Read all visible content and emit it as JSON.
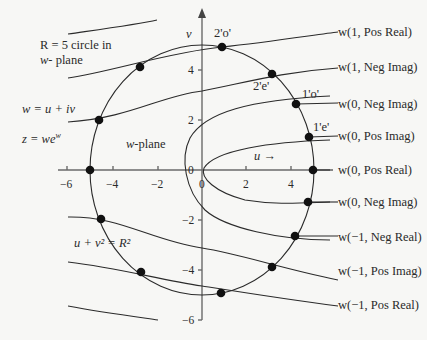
{
  "diagram": {
    "title_note_line1": "R = 5 circle in",
    "title_note_line2_ital": "w",
    "title_note_line2_rest": "- plane",
    "eq_w": "w = u + iv",
    "eq_z": "z = we",
    "eq_z_sup": "w",
    "plane_label_ital": "w",
    "plane_label_rest": "-plane",
    "u_arrow_label": "u →",
    "circle_eq": "u + v² = R²",
    "axes": {
      "u_label": "u",
      "v_label": "v",
      "u_ticks": [
        "−6",
        "−4",
        "−2",
        "0",
        "2",
        "4"
      ],
      "v_ticks": [
        "4",
        "2",
        "0",
        "−2",
        "−4",
        "−6"
      ]
    },
    "point_labels": {
      "p2o": "2'o'",
      "p2e": "2'e'",
      "p1o": "1'o'",
      "p1e": "1'e'"
    },
    "branch_labels": [
      "w(1, Pos Real)",
      "w(1, Neg Imag)",
      "w(0, Neg Imag)",
      "w(0, Pos Imag)",
      "w(0, Pos Real)",
      "w(0, Neg Imag)",
      "w(−1, Neg Real)",
      "w(−1, Pos Imag)",
      "w(−1, Pos Real)"
    ],
    "circle_radius": 5
  }
}
